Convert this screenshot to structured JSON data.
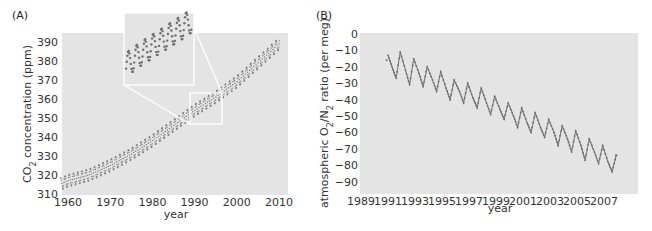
{
  "panels": {
    "a_label": "(A)",
    "b_label": "(B)"
  },
  "chart_data": [
    {
      "id": "A",
      "type": "scatter",
      "title": "",
      "panel_label": "(A)",
      "xlabel": "year",
      "ylabel": "CO2 concentration (ppm)",
      "ylabel_parts": {
        "pre": "CO",
        "sub": "2",
        "post": " concentration (ppm)"
      },
      "xlim": [
        1958,
        2011
      ],
      "ylim": [
        310,
        395
      ],
      "xticks": [
        1960,
        1970,
        1980,
        1990,
        2000,
        2010
      ],
      "yticks": [
        310,
        320,
        330,
        340,
        350,
        360,
        370,
        380,
        390
      ],
      "grid": false,
      "background": "#e4e4e4",
      "point_color": "#777777",
      "seasonal_amplitude_ppm": 3.2,
      "trend": {
        "x": [
          1958,
          1960,
          1965,
          1970,
          1975,
          1980,
          1985,
          1990,
          1995,
          2000,
          2005,
          2010
        ],
        "y": [
          315,
          317,
          320,
          325,
          331,
          338,
          346,
          354,
          361,
          369,
          379,
          389
        ]
      },
      "inset": {
        "source_range_x": [
          1988,
          1996
        ],
        "source_range_y": [
          346,
          364
        ],
        "description": "magnified view of 1988–1995 seasonal cycle"
      }
    },
    {
      "id": "B",
      "type": "line",
      "title": "",
      "panel_label": "(B)",
      "xlabel": "year",
      "ylabel": "atmospheric O2/N2 ratio (per meg)",
      "ylabel_parts": {
        "pre": "atmospheric O",
        "sub1": "2",
        "mid": "/N",
        "sub2": "2",
        "post": " ratio (per meg)"
      },
      "xlim": [
        1989,
        2009
      ],
      "ylim": [
        -97,
        0
      ],
      "xticks": [
        1989,
        1991,
        1993,
        1995,
        1997,
        1999,
        2001,
        2003,
        2005,
        2007
      ],
      "yticks": [
        0,
        -10,
        -20,
        -30,
        -40,
        -50,
        -60,
        -70,
        -80,
        -90
      ],
      "grid": false,
      "background": "#e4e4e4",
      "line_color": "#777777",
      "series": [
        {
          "name": "O2/N2 ratio",
          "x": [
            1991.0,
            1991.3,
            1991.6,
            1991.9,
            1992.3,
            1992.6,
            1992.9,
            1993.3,
            1993.6,
            1993.9,
            1994.3,
            1994.6,
            1994.9,
            1995.3,
            1995.6,
            1995.9,
            1996.3,
            1996.6,
            1996.9,
            1997.3,
            1997.6,
            1997.9,
            1998.3,
            1998.6,
            1998.9,
            1999.3,
            1999.6,
            1999.9,
            2000.3,
            2000.6,
            2000.9,
            2001.3,
            2001.6,
            2001.9,
            2002.3,
            2002.6,
            2002.9,
            2003.3,
            2003.6,
            2003.9,
            2004.3,
            2004.6,
            2004.9,
            2005.3,
            2005.6,
            2005.9,
            2006.3,
            2006.6,
            2006.9,
            2007.3,
            2007.6
          ],
          "y": [
            -13,
            -20,
            -27,
            -11,
            -22,
            -31,
            -15,
            -24,
            -32,
            -20,
            -28,
            -35,
            -23,
            -33,
            -40,
            -28,
            -35,
            -42,
            -30,
            -39,
            -45,
            -33,
            -42,
            -49,
            -38,
            -46,
            -52,
            -42,
            -50,
            -57,
            -45,
            -54,
            -60,
            -48,
            -57,
            -63,
            -52,
            -60,
            -68,
            -56,
            -64,
            -72,
            -59,
            -68,
            -77,
            -64,
            -72,
            -79,
            -68,
            -78,
            -84
          ]
        }
      ],
      "end_point": {
        "x": 2007.9,
        "y": -74
      }
    }
  ]
}
